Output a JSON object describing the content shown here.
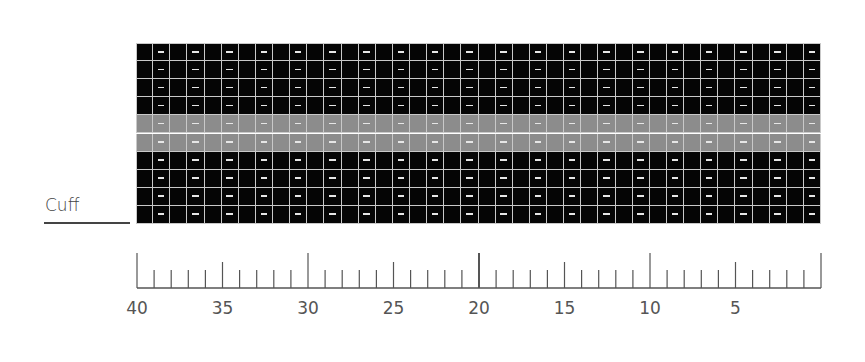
{
  "chart_data": {
    "type": "table",
    "title": "",
    "columns": 40,
    "rows": 10,
    "column_numbering": "right-to-left",
    "row_colors": [
      "black",
      "black",
      "black",
      "black",
      "gray",
      "gray",
      "black",
      "black",
      "black",
      "black"
    ],
    "stitch_pattern": "odd columns (1,3,...,39) purl dash; even columns (2,...,40) knit blank",
    "legend_side_label": "Cuff",
    "ruler": {
      "labels": [
        "40",
        "35",
        "30",
        "25",
        "20",
        "15",
        "10",
        "5"
      ],
      "label_positions": [
        40,
        35,
        30,
        25,
        20,
        15,
        10,
        5
      ],
      "long_ticks": [
        40,
        30,
        20,
        10,
        0
      ],
      "medium_ticks": [
        35,
        25,
        15,
        5
      ]
    }
  },
  "labels": {
    "cuff": "Cuff"
  },
  "colors": {
    "main": "#050505",
    "contrast": "#8c8c8c",
    "grid_line": "#c9c9c9",
    "dash": "#e6e6e6"
  }
}
